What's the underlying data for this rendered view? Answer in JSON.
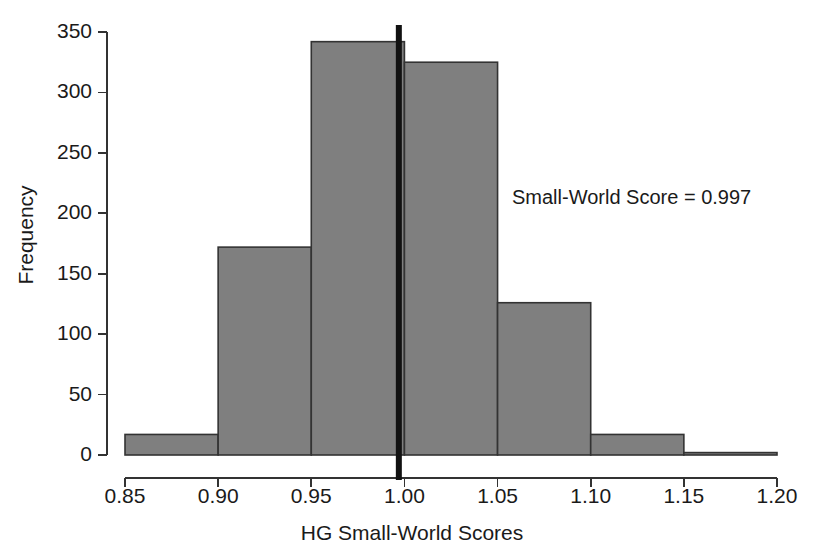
{
  "chart_data": {
    "type": "bar",
    "title": "",
    "subtitle": "",
    "xlabel": "HG Small-World Scores",
    "ylabel": "Frequency",
    "bin_edges": [
      0.85,
      0.9,
      0.95,
      1.0,
      1.05,
      1.1,
      1.15,
      1.2
    ],
    "categories": [
      "0.85-0.90",
      "0.90-0.95",
      "0.95-1.00",
      "1.00-1.05",
      "1.05-1.10",
      "1.10-1.15",
      "1.15-1.20"
    ],
    "values": [
      17,
      172,
      342,
      325,
      126,
      17,
      2
    ],
    "xlim": [
      0.85,
      1.2
    ],
    "ylim": [
      0,
      350
    ],
    "xticks": [
      0.85,
      0.9,
      0.95,
      1.0,
      1.05,
      1.1,
      1.15,
      1.2
    ],
    "xtick_labels": [
      "0.85",
      "0.90",
      "0.95",
      "1.00",
      "1.05",
      "1.10",
      "1.15",
      "1.20"
    ],
    "yticks": [
      0,
      50,
      100,
      150,
      200,
      250,
      300,
      350
    ],
    "ytick_labels": [
      "0",
      "50",
      "100",
      "150",
      "200",
      "250",
      "300",
      "350"
    ],
    "grid": false,
    "legend": null,
    "bar_fill_color": "#7f7f7f",
    "bar_edge_color": "#333333",
    "axis_color": "#333333",
    "marker_line": {
      "label": "Small-World Score = 0.997",
      "value": 0.997,
      "color": "#111111",
      "orientation": "vertical"
    },
    "annotations": [
      {
        "text": "Small-World Score = 0.997",
        "x": 1.07,
        "y": 222
      }
    ]
  }
}
